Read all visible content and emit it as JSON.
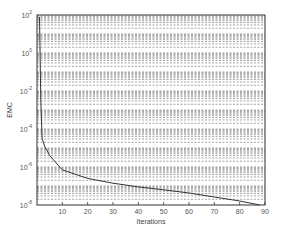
{
  "chart_data": {
    "type": "line",
    "title": "",
    "xlabel": "Iterations",
    "ylabel": "EMC",
    "xlim": [
      0,
      90
    ],
    "ylim_log10": [
      -8,
      2
    ],
    "yscale": "log",
    "grid": true,
    "x_ticks": [
      10,
      20,
      30,
      40,
      50,
      60,
      70,
      80,
      90
    ],
    "y_ticks": [
      {
        "base": "10",
        "exp": "2",
        "log": 2
      },
      {
        "base": "10",
        "exp": "0",
        "log": 0
      },
      {
        "base": "10",
        "exp": "-2",
        "log": -2
      },
      {
        "base": "10",
        "exp": "-4",
        "log": -4
      },
      {
        "base": "10",
        "exp": "-6",
        "log": -6
      },
      {
        "base": "10",
        "exp": "-8",
        "log": -8
      }
    ],
    "series": [
      {
        "name": "EMC",
        "color": "#333333",
        "x": [
          1,
          1.5,
          2,
          3,
          5,
          10,
          20,
          30,
          40,
          50,
          60,
          70,
          80,
          88
        ],
        "log10_y": [
          1.9,
          -2.5,
          -4.5,
          -4.9,
          -5.4,
          -6.15,
          -6.6,
          -6.85,
          -7.05,
          -7.2,
          -7.37,
          -7.58,
          -7.79,
          -8.0
        ]
      }
    ]
  }
}
